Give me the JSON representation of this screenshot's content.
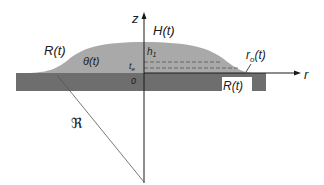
{
  "diagram": {
    "colors": {
      "background": "#ffffff",
      "substrate": "#6e6e6e",
      "droplet": "#a9a9a9",
      "axes": "#1a1a1a",
      "dashed": "#555555"
    },
    "labels": {
      "z_axis": "z",
      "r_axis": "r",
      "height": "H(t)",
      "left_radius": "R(t)",
      "contact_angle": "θ(t)",
      "h1": "h",
      "h1_sub": "1",
      "t_e": "t",
      "t_e_sub": "e",
      "origin": "0",
      "r0": "r",
      "r0_sub": "o",
      "r0_suffix": "(t)",
      "right_radius": "R(t)",
      "curvature": "ℜ"
    }
  }
}
